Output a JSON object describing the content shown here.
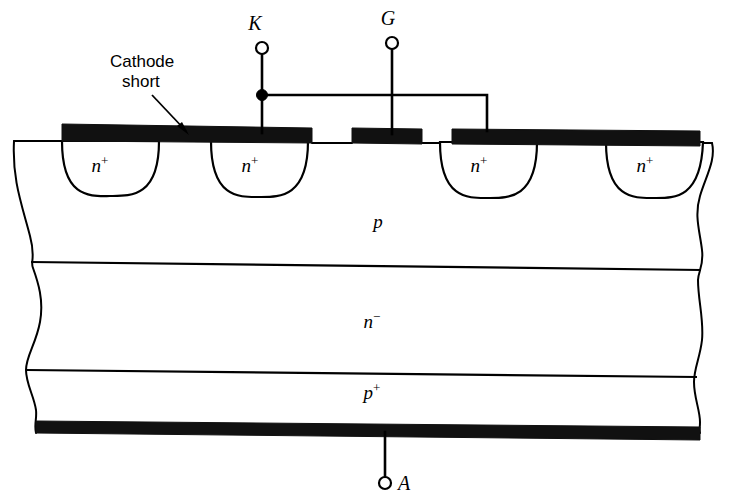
{
  "figure": {
    "background_color": "#ffffff",
    "line_color": "#000000",
    "metal_color": "#111111"
  },
  "terminals": [
    {
      "id": "cathode",
      "label": "K",
      "x": 262,
      "y": 27
    },
    {
      "id": "gate",
      "label": "G",
      "x": 392,
      "y": 22
    },
    {
      "id": "anode",
      "label": "A",
      "x": 385,
      "y": 485
    }
  ],
  "callouts": [
    {
      "id": "cathode-short",
      "line1": "Cathode",
      "line2": "short"
    }
  ],
  "regions": [
    {
      "id": "nplus-1",
      "base": "n",
      "sup": "+",
      "x": 100,
      "y": 172
    },
    {
      "id": "nplus-2",
      "base": "n",
      "sup": "+",
      "x": 250,
      "y": 172
    },
    {
      "id": "nplus-3",
      "base": "n",
      "sup": "+",
      "x": 482,
      "y": 172
    },
    {
      "id": "nplus-4",
      "base": "n",
      "sup": "+",
      "x": 648,
      "y": 172
    },
    {
      "id": "p-base",
      "base": "p",
      "sup": "",
      "x": 378,
      "y": 228
    },
    {
      "id": "n-drift",
      "base": "n",
      "sup": "−",
      "x": 372,
      "y": 328
    },
    {
      "id": "p-emitter",
      "base": "p",
      "sup": "+",
      "x": 372,
      "y": 399
    }
  ],
  "electrodes": [
    {
      "id": "cathode-metal-left",
      "x": 62,
      "y": 124,
      "width": 250,
      "height": 13
    },
    {
      "id": "gate-metal-pad",
      "x": 352,
      "y": 128,
      "width": 70,
      "height": 13
    },
    {
      "id": "cathode-metal-right",
      "x": 452,
      "y": 128,
      "width": 248,
      "height": 13
    },
    {
      "id": "anode-metal",
      "x": 36,
      "y": 421,
      "width": 664,
      "height": 12
    }
  ],
  "layer_labels": {
    "p_base": "p",
    "n_drift": "n",
    "n_drift_sup": "−",
    "p_emitter": "p",
    "p_emitter_sup": "+",
    "n_plus": "n",
    "n_plus_sup": "+"
  }
}
